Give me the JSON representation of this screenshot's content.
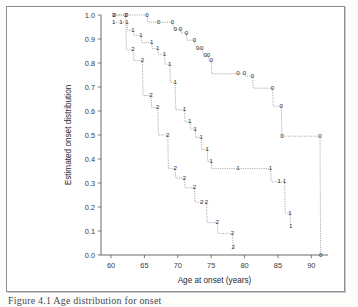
{
  "figure": {
    "caption": "Figure 4.1 Age distribution for onset",
    "background_color": "#ffffff",
    "frame_color": "#8f8f93"
  },
  "chart_data": {
    "type": "line",
    "subtype": "step",
    "title": "",
    "xlabel": "Age at onset (years)",
    "ylabel": "Estimated onset distribution",
    "xlim": [
      58.5,
      92.5
    ],
    "ylim": [
      0.0,
      1.0
    ],
    "xticks": [
      60,
      65,
      70,
      75,
      80,
      85,
      90
    ],
    "xtick_labels": [
      "60",
      "65",
      "70",
      "75",
      "80",
      "85",
      "90"
    ],
    "yticks": [
      0.0,
      0.1,
      0.2,
      0.3,
      0.4,
      0.5,
      0.6,
      0.7,
      0.8,
      0.9,
      1.0
    ],
    "ytick_labels": [
      "0.0",
      "0.1",
      "0.2",
      "0.3",
      "0.4",
      "0.5",
      "0.6",
      "0.7",
      "0.8",
      "0.9",
      "1.0"
    ],
    "grid": false,
    "legend": "none",
    "marker_style": "group-digit",
    "line_style": "dotted",
    "line_color": "#77777c",
    "series": [
      {
        "name": "0",
        "marker_label": "0",
        "points": [
          [
            60.4,
            1.0
          ],
          [
            62.3,
            1.0
          ],
          [
            65.4,
            1.0
          ],
          [
            65.5,
            0.97
          ],
          [
            67.1,
            0.97
          ],
          [
            69.2,
            0.97
          ],
          [
            69.3,
            0.955
          ],
          [
            69.6,
            0.94
          ],
          [
            70.4,
            0.94
          ],
          [
            70.5,
            0.925
          ],
          [
            71.3,
            0.925
          ],
          [
            71.4,
            0.895
          ],
          [
            72.5,
            0.895
          ],
          [
            72.6,
            0.875
          ],
          [
            73.0,
            0.86
          ],
          [
            73.6,
            0.86
          ],
          [
            73.7,
            0.845
          ],
          [
            74.1,
            0.83
          ],
          [
            74.6,
            0.83
          ],
          [
            74.7,
            0.81
          ],
          [
            75.0,
            0.81
          ],
          [
            75.1,
            0.755
          ],
          [
            79.0,
            0.755
          ],
          [
            80.0,
            0.755
          ],
          [
            80.1,
            0.745
          ],
          [
            81.2,
            0.745
          ],
          [
            81.3,
            0.695
          ],
          [
            84.2,
            0.695
          ],
          [
            84.3,
            0.62
          ],
          [
            85.5,
            0.62
          ],
          [
            85.6,
            0.495
          ],
          [
            91.3,
            0.495
          ],
          [
            91.4,
            0.0
          ]
        ]
      },
      {
        "name": "1",
        "marker_label": "1",
        "points": [
          [
            60.4,
            0.97
          ],
          [
            61.5,
            0.97
          ],
          [
            62.4,
            0.97
          ],
          [
            62.5,
            0.935
          ],
          [
            63.3,
            0.935
          ],
          [
            63.4,
            0.915
          ],
          [
            64.5,
            0.915
          ],
          [
            64.6,
            0.885
          ],
          [
            66.1,
            0.885
          ],
          [
            66.2,
            0.86
          ],
          [
            67.0,
            0.86
          ],
          [
            67.1,
            0.835
          ],
          [
            68.0,
            0.835
          ],
          [
            68.1,
            0.795
          ],
          [
            68.8,
            0.795
          ],
          [
            68.9,
            0.72
          ],
          [
            69.6,
            0.72
          ],
          [
            69.7,
            0.605
          ],
          [
            71.0,
            0.605
          ],
          [
            71.1,
            0.555
          ],
          [
            71.8,
            0.555
          ],
          [
            71.9,
            0.525
          ],
          [
            72.6,
            0.525
          ],
          [
            72.7,
            0.49
          ],
          [
            73.5,
            0.49
          ],
          [
            73.6,
            0.44
          ],
          [
            74.4,
            0.44
          ],
          [
            74.5,
            0.39
          ],
          [
            75.0,
            0.39
          ],
          [
            75.1,
            0.36
          ],
          [
            79.0,
            0.36
          ],
          [
            83.9,
            0.36
          ],
          [
            84.0,
            0.305
          ],
          [
            85.2,
            0.305
          ],
          [
            85.3,
            0.305
          ],
          [
            86.0,
            0.305
          ],
          [
            86.1,
            0.175
          ],
          [
            86.8,
            0.175
          ],
          [
            86.9,
            0.12
          ]
        ]
      },
      {
        "name": "2",
        "marker_label": "2",
        "points": [
          [
            60.5,
            1.0
          ],
          [
            62.2,
            1.0
          ],
          [
            62.3,
            0.855
          ],
          [
            63.3,
            0.855
          ],
          [
            63.4,
            0.81
          ],
          [
            64.7,
            0.81
          ],
          [
            64.8,
            0.665
          ],
          [
            66.0,
            0.665
          ],
          [
            66.1,
            0.615
          ],
          [
            67.0,
            0.615
          ],
          [
            67.1,
            0.5
          ],
          [
            68.5,
            0.5
          ],
          [
            68.6,
            0.36
          ],
          [
            69.6,
            0.36
          ],
          [
            69.7,
            0.32
          ],
          [
            71.0,
            0.32
          ],
          [
            71.1,
            0.28
          ],
          [
            72.5,
            0.28
          ],
          [
            72.6,
            0.22
          ],
          [
            73.6,
            0.22
          ],
          [
            73.7,
            0.22
          ],
          [
            74.3,
            0.22
          ],
          [
            74.4,
            0.135
          ],
          [
            75.9,
            0.135
          ],
          [
            76.0,
            0.09
          ],
          [
            78.2,
            0.09
          ],
          [
            78.3,
            0.03
          ]
        ]
      }
    ],
    "marker_positions": {
      "0": [
        [
          60.4,
          1.0
        ],
        [
          62.3,
          1.0
        ],
        [
          65.4,
          1.0
        ],
        [
          67.1,
          0.97
        ],
        [
          69.2,
          0.97
        ],
        [
          69.6,
          0.94
        ],
        [
          70.4,
          0.94
        ],
        [
          71.3,
          0.925
        ],
        [
          72.5,
          0.895
        ],
        [
          73.0,
          0.86
        ],
        [
          73.6,
          0.86
        ],
        [
          74.1,
          0.83
        ],
        [
          74.6,
          0.83
        ],
        [
          75.0,
          0.81
        ],
        [
          79.0,
          0.755
        ],
        [
          80.0,
          0.755
        ],
        [
          81.2,
          0.745
        ],
        [
          84.2,
          0.695
        ],
        [
          85.5,
          0.62
        ],
        [
          91.3,
          0.495
        ],
        [
          85.6,
          0.495
        ],
        [
          91.4,
          0.0
        ]
      ],
      "1": [
        [
          60.4,
          0.97
        ],
        [
          61.5,
          0.97
        ],
        [
          62.4,
          0.97
        ],
        [
          63.3,
          0.935
        ],
        [
          64.5,
          0.915
        ],
        [
          66.1,
          0.885
        ],
        [
          67.0,
          0.86
        ],
        [
          68.0,
          0.835
        ],
        [
          68.8,
          0.795
        ],
        [
          69.6,
          0.72
        ],
        [
          71.0,
          0.605
        ],
        [
          71.8,
          0.555
        ],
        [
          72.6,
          0.525
        ],
        [
          73.5,
          0.49
        ],
        [
          74.4,
          0.44
        ],
        [
          75.0,
          0.39
        ],
        [
          79.0,
          0.36
        ],
        [
          83.9,
          0.36
        ],
        [
          85.2,
          0.305
        ],
        [
          86.0,
          0.305
        ],
        [
          86.8,
          0.175
        ],
        [
          86.9,
          0.12
        ]
      ],
      "2": [
        [
          60.5,
          1.0
        ],
        [
          62.2,
          1.0
        ],
        [
          63.3,
          0.855
        ],
        [
          64.7,
          0.81
        ],
        [
          66.0,
          0.665
        ],
        [
          67.0,
          0.615
        ],
        [
          68.5,
          0.5
        ],
        [
          69.6,
          0.36
        ],
        [
          71.0,
          0.32
        ],
        [
          72.5,
          0.28
        ],
        [
          73.6,
          0.22
        ],
        [
          74.3,
          0.22
        ],
        [
          75.9,
          0.135
        ],
        [
          78.2,
          0.09
        ],
        [
          78.3,
          0.03
        ]
      ]
    }
  }
}
